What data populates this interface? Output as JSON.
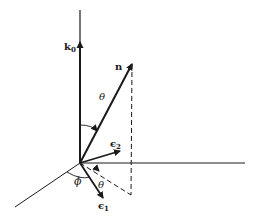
{
  "diagram": {
    "type": "vector-geometry",
    "labels": {
      "k0": {
        "main": "k",
        "sub": "0"
      },
      "n": "n",
      "theta_upper": "θ",
      "epsilon2": {
        "main": "є",
        "sub": "2"
      },
      "phi": "ϕ",
      "theta_lower": "θ",
      "epsilon1": {
        "main": "є",
        "sub": "1"
      }
    },
    "colors": {
      "ink": "#1a1a1a",
      "background": "#ffffff"
    },
    "geometry": {
      "origin": [
        80,
        163
      ],
      "vertical_axis_top": [
        80,
        10
      ],
      "horizontal_axis_end": [
        245,
        163
      ],
      "oblique_axis_end": [
        15,
        207
      ],
      "k0_tip": [
        80,
        42
      ],
      "n_tip": [
        132,
        64
      ],
      "projection_foot": [
        131,
        195
      ],
      "epsilon1_tip": [
        103,
        198
      ],
      "epsilon2_tip": [
        120,
        151
      ]
    }
  }
}
